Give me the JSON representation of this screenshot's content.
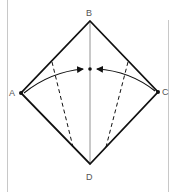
{
  "diagram": {
    "type": "origami-fold-diagram",
    "points": {
      "A": {
        "label": "A",
        "x": 21,
        "y": 93
      },
      "B": {
        "label": "B",
        "x": 90,
        "y": 21
      },
      "C": {
        "label": "C",
        "x": 158,
        "y": 92
      },
      "D": {
        "label": "D",
        "x": 90,
        "y": 164
      },
      "center": {
        "x": 90,
        "y": 69
      }
    },
    "labels": {
      "A": "A",
      "B": "B",
      "C": "C",
      "D": "D"
    },
    "lines": {
      "outline": "square rotated 45° (diamond) A-B-C-D",
      "center_crease": "B to D (thin solid)",
      "valley_folds": [
        "left dashed from AB edge to AD edge",
        "right dashed from BC edge to CD edge"
      ],
      "arrows": [
        "A curves to center",
        "C curves to center"
      ]
    },
    "colors": {
      "stroke": "#111111",
      "crease": "#777777",
      "frame": "#c8c8c8",
      "label": "#555555"
    }
  }
}
